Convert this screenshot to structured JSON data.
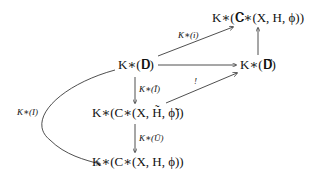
{
  "nodes": {
    "top_right": "K∗(𝐂∗(X, H, ϕ))",
    "d": "K∗(𝐃)",
    "d_tilde": "K∗(𝐃̃)",
    "middle": "K∗(C∗(X, H̃, ϕ̃))",
    "bottom": "K∗(C∗(X, H, ϕ))"
  },
  "arrows": {
    "i": "K∗(i)",
    "i_tilde": "K∗(Ĩ)",
    "u_tilde": "K∗(Ũ)",
    "l": "K∗(I)",
    "unique": "!"
  }
}
